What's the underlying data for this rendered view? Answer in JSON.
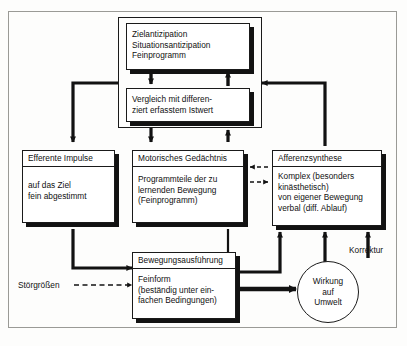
{
  "diagram": {
    "language": "de",
    "background_color": "#fdfdfc",
    "line_color": "#1a1a1a",
    "shadow_color": "#121212"
  },
  "nodes": {
    "zielantizipation": {
      "lines": [
        "Zielantizipation",
        "Situationsantizipation",
        "Feinprogramm"
      ]
    },
    "vergleich": {
      "lines": [
        "Vergleich mit differen-",
        "ziert erfasstem Istwert"
      ]
    },
    "efferente_impulse": {
      "header": "Efferente Impulse",
      "lines": [
        "auf das Ziel",
        "fein abgestimmt"
      ]
    },
    "motorisches_gedaechtnis": {
      "header": "Motorisches Gedächtnis",
      "lines": [
        "Programmteile der zu",
        "lernenden Bewegung",
        "(Feinprogramm)"
      ]
    },
    "afferenzsynthese": {
      "header": "Afferenzsynthese",
      "lines": [
        "Komplex (besonders",
        "kinästhetisch)",
        "von eigener Bewegung",
        "verbal (diff. Ablauf)"
      ]
    },
    "bewegungsausfuehrung": {
      "header": "Bewegungsausführung",
      "lines": [
        "Feinform",
        "(beständig unter ein-",
        "fachen Bedingungen)"
      ]
    },
    "wirkung_auf_umwelt": {
      "lines": [
        "Wirkung",
        "auf",
        "Umwelt"
      ]
    }
  },
  "labels": {
    "stoergroessen": "Störgrößen",
    "korrektur": "Korrektur"
  }
}
